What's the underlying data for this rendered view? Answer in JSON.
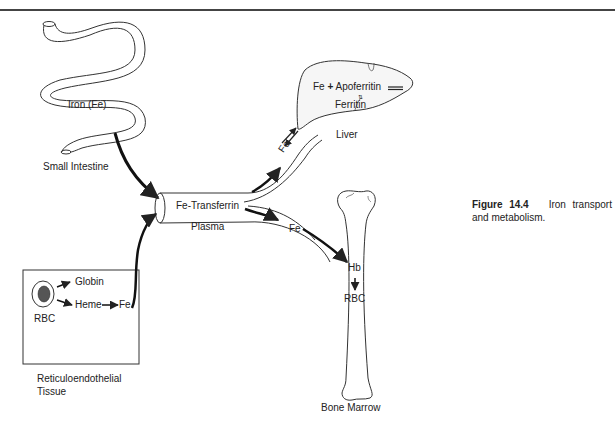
{
  "figure": {
    "number": "Figure 14.4",
    "caption": "Iron transport and metabolism."
  },
  "labels": {
    "intestine_inside": "Iron (Fe)",
    "small_intestine": "Small Intestine",
    "liver_reaction_left": "Fe",
    "liver_reaction_plus": "+",
    "liver_reaction_right": "Apoferritin",
    "liver_equilibrium": "⇅",
    "liver_product": "Ferritin",
    "liver": "Liver",
    "fe_to_liver": "Fe",
    "plasma_tube": "Fe-Transferrin",
    "plasma": "Plasma",
    "fe_to_marrow": "Fe",
    "hb": "Hb",
    "rbc_marrow": "RBC",
    "bone_marrow": "Bone Marrow",
    "globin": "Globin",
    "heme": "Heme",
    "fe_re": "Fe",
    "rbc_re": "RBC",
    "re_tissue_line1": "Reticuloendothelial",
    "re_tissue_line2": "Tissue"
  },
  "colors": {
    "line": "#222222",
    "rule": "#444444",
    "background": "#ffffff"
  }
}
